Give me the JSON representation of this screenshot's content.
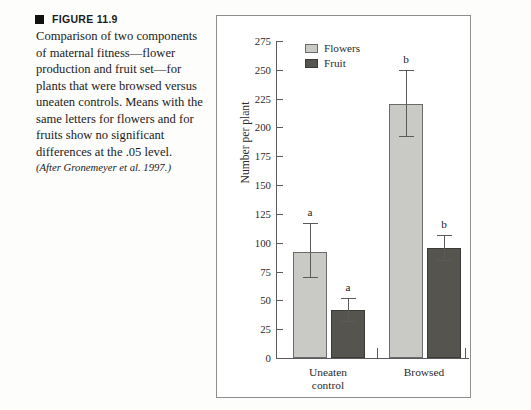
{
  "caption": {
    "marker_icon": "filled-square-icon",
    "figure_label": "FIGURE 11.9",
    "body": "Comparison of two components of maternal fitness—flower production and fruit set—for plants that were browsed versus uneaten controls. Means with the same letters for flowers and for fruits show no significant differences at the .05 level.",
    "source": "(After Gronemeyer et al. 1997.)"
  },
  "chart_data": {
    "type": "bar",
    "title": "",
    "xlabel": "",
    "ylabel": "Number per plant",
    "ylim": [
      0,
      275
    ],
    "yticks": [
      0,
      25,
      50,
      75,
      100,
      125,
      150,
      175,
      200,
      225,
      250,
      275
    ],
    "ytick_labels": [
      "0",
      "25",
      "50",
      "75",
      "100",
      "125",
      "150",
      "175",
      "200",
      "225",
      "250",
      "275"
    ],
    "grid": false,
    "legend_position": "top-left-inside",
    "categories": [
      "Uneaten control",
      "Browsed"
    ],
    "category_lines": [
      [
        "Uneaten",
        "control"
      ],
      [
        "Browsed"
      ]
    ],
    "series": [
      {
        "name": "Flowers",
        "color": "#c9c9c5",
        "values": [
          92,
          220
        ],
        "error_low": [
          70,
          193
        ],
        "error_high": [
          117,
          250
        ],
        "significance_letters": [
          "a",
          "b"
        ]
      },
      {
        "name": "Fruit",
        "color": "#55544f",
        "values": [
          42,
          95
        ],
        "error_low": [
          32,
          85
        ],
        "error_high": [
          52,
          107
        ],
        "significance_letters": [
          "a",
          "b"
        ]
      }
    ]
  }
}
